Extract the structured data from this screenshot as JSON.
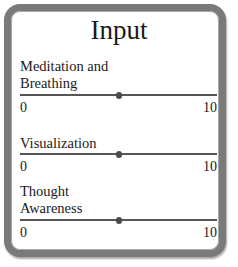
{
  "panel": {
    "title": "Input",
    "border_color": "#7a7a7a",
    "sliders": [
      {
        "label_line1": "Meditation and",
        "label_line2": "Breathing",
        "min": "0",
        "max": "10",
        "value": 5
      },
      {
        "label_line1": "Visualization",
        "label_line2": "",
        "min": "0",
        "max": "10",
        "value": 5
      },
      {
        "label_line1": "Thought",
        "label_line2": "Awareness",
        "min": "0",
        "max": "10",
        "value": 5
      }
    ]
  }
}
